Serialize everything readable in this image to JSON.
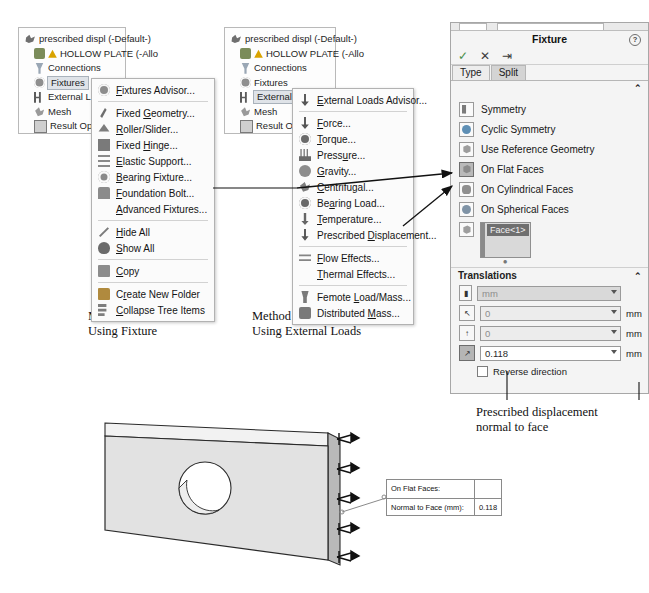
{
  "tree1": {
    "name": "feature-tree-fixtures",
    "items": [
      {
        "label": "prescribed displ (-Default-)",
        "icon": "study-root-icon",
        "indent": false,
        "selected": false
      },
      {
        "label": "HOLLOW PLATE (-Allo",
        "icon": "part-warning-icon",
        "indent": true,
        "selected": false
      },
      {
        "label": "Connections",
        "icon": "connections-icon",
        "indent": true,
        "selected": false
      },
      {
        "label": "Fixtures",
        "icon": "fixtures-icon",
        "indent": true,
        "selected": true
      },
      {
        "label": "External L",
        "icon": "external-loads-icon",
        "indent": true,
        "selected": false
      },
      {
        "label": "Mesh",
        "icon": "mesh-icon",
        "indent": true,
        "selected": false
      },
      {
        "label": "Result Op",
        "icon": "result-options-icon",
        "indent": true,
        "selected": false
      }
    ]
  },
  "tree2": {
    "name": "feature-tree-external-loads",
    "items": [
      {
        "label": "prescribed displ (-Default-)",
        "icon": "study-root-icon",
        "indent": false,
        "selected": false
      },
      {
        "label": "HOLLOW PLATE (-Allo",
        "icon": "part-warning-icon",
        "indent": true,
        "selected": false
      },
      {
        "label": "Connections",
        "icon": "connections-icon",
        "indent": true,
        "selected": false
      },
      {
        "label": "Fixtures",
        "icon": "fixtures-icon",
        "indent": true,
        "selected": false
      },
      {
        "label": "External",
        "icon": "external-loads-icon",
        "indent": true,
        "selected": true
      },
      {
        "label": "Mesh",
        "icon": "mesh-icon",
        "indent": true,
        "selected": false
      },
      {
        "label": "Result O",
        "icon": "result-options-icon",
        "indent": true,
        "selected": false
      }
    ]
  },
  "menu1": {
    "name": "fixtures-context-menu",
    "groups": [
      [
        {
          "label": "Fixtures Advisor...",
          "icon": "advisor-icon",
          "mnemonic": "F"
        }
      ],
      [
        {
          "label": "Fixed Geometry...",
          "icon": "fixed-geometry-icon",
          "mnemonic": "G"
        },
        {
          "label": "Roller/Slider...",
          "icon": "roller-slider-icon",
          "mnemonic": "R"
        },
        {
          "label": "Fixed Hinge...",
          "icon": "fixed-hinge-icon",
          "mnemonic": "H"
        },
        {
          "label": "Elastic Support...",
          "icon": "elastic-support-icon",
          "mnemonic": "E"
        },
        {
          "label": "Bearing Fixture...",
          "icon": "bearing-fixture-icon",
          "mnemonic": "B"
        },
        {
          "label": "Foundation Bolt...",
          "icon": "foundation-bolt-icon",
          "mnemonic": "F"
        },
        {
          "label": "Advanced Fixtures...",
          "icon": "none",
          "mnemonic": "A"
        }
      ],
      [
        {
          "label": "Hide All",
          "icon": "hide-all-icon",
          "mnemonic": "H"
        },
        {
          "label": "Show All",
          "icon": "show-all-icon",
          "mnemonic": "S"
        }
      ],
      [
        {
          "label": "Copy",
          "icon": "copy-icon",
          "mnemonic": "C"
        }
      ],
      [
        {
          "label": "Create New Folder",
          "icon": "new-folder-icon",
          "mnemonic": "r"
        },
        {
          "label": "Collapse Tree Items",
          "icon": "collapse-tree-icon",
          "mnemonic": "C"
        }
      ]
    ]
  },
  "menu2": {
    "name": "external-loads-context-menu",
    "groups": [
      [
        {
          "label": "External Loads Advisor...",
          "icon": "external-loads-advisor-icon",
          "mnemonic": "E"
        }
      ],
      [
        {
          "label": "Force...",
          "icon": "force-icon",
          "mnemonic": "F"
        },
        {
          "label": "Torque...",
          "icon": "torque-icon",
          "mnemonic": "T"
        },
        {
          "label": "Pressure...",
          "icon": "pressure-icon",
          "mnemonic": "u"
        },
        {
          "label": "Gravity...",
          "icon": "gravity-icon",
          "mnemonic": "G"
        },
        {
          "label": "Centrifugal...",
          "icon": "centrifugal-icon",
          "mnemonic": "C"
        },
        {
          "label": "Bearing Load...",
          "icon": "bearing-load-icon",
          "mnemonic": "a"
        },
        {
          "label": "Temperature...",
          "icon": "temperature-icon",
          "mnemonic": "T"
        },
        {
          "label": "Prescribed Displacement...",
          "icon": "prescribed-displacement-icon",
          "mnemonic": "D"
        }
      ],
      [
        {
          "label": "Flow Effects...",
          "icon": "flow-effects-icon",
          "mnemonic": "F"
        },
        {
          "label": "Thermal Effects...",
          "icon": "none",
          "mnemonic": "T"
        }
      ],
      [
        {
          "label": "Femote Load/Mass...",
          "icon": "remote-load-icon",
          "mnemonic": "L"
        },
        {
          "label": "Distributed Mass...",
          "icon": "distributed-mass-icon",
          "mnemonic": "M"
        }
      ]
    ]
  },
  "property_manager": {
    "name": "fixture-property-manager",
    "title": "Fixture",
    "help_glyph": "?",
    "actions": {
      "ok": "✓",
      "cancel": "✕",
      "pin": "⇥"
    },
    "tabs": [
      {
        "label": "Type",
        "active": false
      },
      {
        "label": "Split",
        "active": true
      }
    ],
    "type_section": {
      "header": "",
      "collapse_glyph": "⌃",
      "options": [
        {
          "label": "Symmetry",
          "icon": "symmetry-icon",
          "selected": false
        },
        {
          "label": "Cyclic Symmetry",
          "icon": "cyclic-symmetry-icon",
          "selected": false
        },
        {
          "label": "Use Reference Geometry",
          "icon": "reference-geometry-icon",
          "selected": false
        },
        {
          "label": "On Flat Faces",
          "icon": "on-flat-faces-icon",
          "selected": true
        },
        {
          "label": "On Cylindrical Faces",
          "icon": "on-cylindrical-faces-icon",
          "selected": false
        },
        {
          "label": "On Spherical Faces",
          "icon": "on-spherical-faces-icon",
          "selected": false
        }
      ],
      "selection": {
        "icon": "face-selection-icon",
        "items": [
          "Face<1>"
        ]
      }
    },
    "translations": {
      "header": "Translations",
      "collapse_glyph": "⌃",
      "unit_icon": "units-icon",
      "unit_value": "mm",
      "fields": [
        {
          "icon": "translation-x-icon",
          "value": "0",
          "unit": "mm",
          "active": false
        },
        {
          "icon": "translation-y-icon",
          "value": "0",
          "unit": "mm",
          "active": false
        },
        {
          "icon": "translation-z-icon",
          "value": "0.118",
          "unit": "mm",
          "active": true
        }
      ],
      "reverse_label": "Reverse direction",
      "reverse_checked": false
    }
  },
  "captions": {
    "method1_line1": "Method 1",
    "method1_line2": "Using Fixture",
    "method2_line1": "Method 2",
    "method2_line2": "Using External Loads",
    "prescribed_line1": "Prescribed displacement",
    "prescribed_line2": "normal to face"
  },
  "callout": {
    "name": "model-callout",
    "row1_label": "On Flat Faces:",
    "row1_value": "",
    "row2_label": "Normal to Face (mm):",
    "row2_value": "0.118"
  },
  "model": {
    "name": "hollow-plate-3d-model",
    "description": "hollow plate with circular hole and restraint symbols on right edge"
  },
  "colors": {
    "panel_bg": "#f4f4f4",
    "menu_bg": "#fbfbfb",
    "selection_highlight": "#6f6f6f",
    "tree_selection": "#dfe3e8",
    "active_field": "#ffffff",
    "model_face": "#e2e2e2"
  }
}
